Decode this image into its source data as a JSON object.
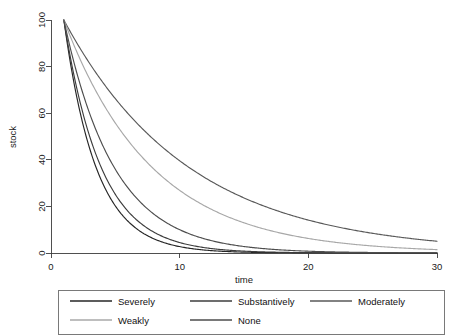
{
  "chart_data": {
    "type": "line",
    "title": "",
    "xlabel": "time",
    "ylabel": "stock",
    "xlim": [
      0,
      30
    ],
    "ylim": [
      0,
      100
    ],
    "xticks": [
      0,
      10,
      20,
      30
    ],
    "yticks": [
      0,
      20,
      40,
      60,
      80,
      100
    ],
    "xtick_labels": [
      "0",
      "10",
      "20",
      "30"
    ],
    "ytick_labels": [
      "0",
      "20",
      "40",
      "60",
      "80",
      "100"
    ],
    "grid": false,
    "legend_position": "bottom",
    "x": [
      1,
      2,
      3,
      4,
      5,
      6,
      7,
      8,
      9,
      10,
      11,
      12,
      13,
      14,
      15,
      16,
      17,
      18,
      19,
      20,
      21,
      22,
      23,
      24,
      25,
      26,
      27,
      28,
      29,
      30
    ],
    "series": [
      {
        "name": "Severely",
        "color": "#262626",
        "decay_rate": 0.4,
        "values": [
          100,
          67,
          44.9,
          30.1,
          20.2,
          13.5,
          9.1,
          6.1,
          4.1,
          2.7,
          1.8,
          1.2,
          0.8,
          0.55,
          0.37,
          0.25,
          0.17,
          0.11,
          0.07,
          0.05,
          0.03,
          0.02,
          0.015,
          0.01,
          0.007,
          0.004,
          0.003,
          0.002,
          0.001,
          0.001
        ]
      },
      {
        "name": "Substantively",
        "color": "#3d3d3d",
        "decay_rate": 0.345,
        "values": [
          100,
          70.8,
          50.2,
          35.5,
          25.2,
          17.8,
          12.6,
          8.9,
          6.3,
          4.5,
          3.2,
          2.3,
          1.6,
          1.1,
          0.8,
          0.57,
          0.4,
          0.28,
          0.2,
          0.14,
          0.1,
          0.07,
          0.05,
          0.04,
          0.025,
          0.018,
          0.013,
          0.009,
          0.006,
          0.004
        ]
      },
      {
        "name": "Moderately",
        "color": "#595959",
        "decay_rate": 0.103,
        "values": [
          100,
          90.2,
          81.4,
          73.4,
          66.2,
          59.7,
          53.9,
          48.6,
          43.9,
          39.6,
          35.7,
          32.2,
          29.0,
          26.2,
          23.6,
          21.3,
          19.2,
          17.3,
          15.6,
          14.1,
          12.7,
          11.5,
          10.4,
          9.3,
          8.4,
          7.6,
          6.9,
          6.2,
          5.6,
          5.0
        ]
      },
      {
        "name": "Weakly",
        "color": "#a8a8a8",
        "decay_rate": 0.146,
        "values": [
          100,
          86.4,
          74.7,
          64.5,
          55.8,
          48.2,
          41.6,
          36.0,
          31.1,
          26.9,
          23.2,
          20.1,
          17.3,
          15.0,
          12.9,
          11.2,
          9.7,
          8.4,
          7.2,
          6.2,
          5.4,
          4.7,
          4.0,
          3.5,
          3.0,
          2.6,
          2.2,
          1.9,
          1.7,
          1.4
        ]
      },
      {
        "name": "None",
        "color": "#4d4d4d",
        "decay_rate": 0.256,
        "values": [
          100,
          77.4,
          59.9,
          46.4,
          35.9,
          27.8,
          21.5,
          16.6,
          12.9,
          10.0,
          7.7,
          6.0,
          4.6,
          3.6,
          2.8,
          2.1,
          1.7,
          1.3,
          1.0,
          0.78,
          0.6,
          0.47,
          0.36,
          0.28,
          0.22,
          0.17,
          0.13,
          0.1,
          0.08,
          0.06
        ]
      }
    ]
  },
  "axes": {
    "x_title": "time",
    "y_title": "stock"
  },
  "legend": {
    "entries": [
      {
        "label": "Severely",
        "color": "#262626"
      },
      {
        "label": "Substantively",
        "color": "#3d3d3d"
      },
      {
        "label": "Moderately",
        "color": "#595959"
      },
      {
        "label": "Weakly",
        "color": "#a8a8a8"
      },
      {
        "label": "None",
        "color": "#4d4d4d"
      }
    ]
  }
}
